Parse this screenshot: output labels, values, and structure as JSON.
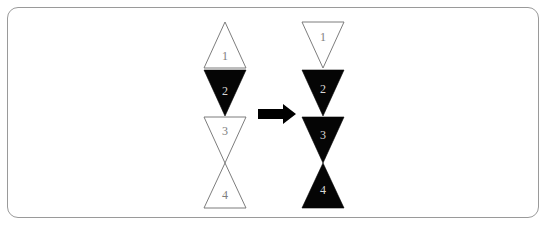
{
  "figure": {
    "background_color": "#ffffff",
    "border_color": "#9a9a9a",
    "fill_black": "#050505",
    "fill_white": "#ffffff",
    "outline_color": "#6e6e6e",
    "label_color_on_white": "#7d7d7d",
    "label_color_on_black": "#d8d8d8"
  },
  "arrow": {
    "symbol": "→",
    "label": "transforms to"
  },
  "left_group": {
    "name": "before",
    "center_x": 225,
    "triangles": [
      {
        "label": "1",
        "orientation": "up",
        "fill": "white",
        "top": 22,
        "bottom": 68,
        "left": 204,
        "right": 246
      },
      {
        "label": "2",
        "orientation": "down",
        "fill": "black",
        "top": 70,
        "bottom": 116,
        "left": 204,
        "right": 246
      },
      {
        "label": "3",
        "orientation": "down",
        "fill": "white",
        "top": 117,
        "bottom": 163,
        "left": 204,
        "right": 246
      },
      {
        "label": "4",
        "orientation": "up",
        "fill": "white",
        "top": 163,
        "bottom": 208,
        "left": 204,
        "right": 246
      }
    ]
  },
  "right_group": {
    "name": "after",
    "center_x": 323,
    "triangles": [
      {
        "label": "1",
        "orientation": "down",
        "fill": "white",
        "top": 22,
        "bottom": 68,
        "left": 302,
        "right": 344
      },
      {
        "label": "2",
        "orientation": "down",
        "fill": "black",
        "top": 70,
        "bottom": 116,
        "left": 302,
        "right": 344
      },
      {
        "label": "3",
        "orientation": "down",
        "fill": "black",
        "top": 117,
        "bottom": 163,
        "left": 302,
        "right": 344
      },
      {
        "label": "4",
        "orientation": "up",
        "fill": "black",
        "top": 163,
        "bottom": 208,
        "left": 302,
        "right": 344
      }
    ]
  }
}
